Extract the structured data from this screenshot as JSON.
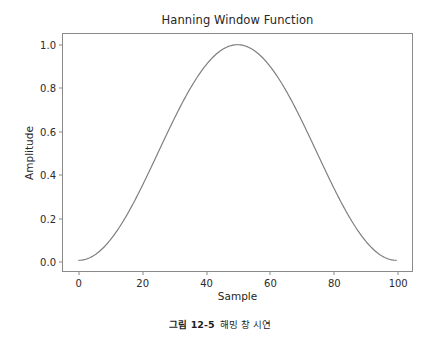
{
  "figure": {
    "caption_number": "그림 12-5",
    "caption_text": "해밍 창 시연"
  },
  "chart_data": {
    "type": "line",
    "title": "Hanning Window Function",
    "xlabel": "Sample",
    "ylabel": "Amplitude",
    "xlim": [
      -4.95,
      104.95
    ],
    "ylim": [
      -0.0497,
      1.0497
    ],
    "xticks": [
      0,
      20,
      40,
      60,
      80,
      100
    ],
    "xticklabels": [
      "0",
      "20",
      "40",
      "60",
      "80",
      "100"
    ],
    "yticks": [
      0.0,
      0.2,
      0.4,
      0.6,
      0.8,
      1.0
    ],
    "yticklabels": [
      "0.0",
      "0.2",
      "0.4",
      "0.6",
      "0.8",
      "1.0"
    ],
    "grid": false,
    "legend": null,
    "line_color": "#7f7f7f",
    "line_width": 1.2,
    "series": [
      {
        "name": "Hanning window",
        "x": [
          0,
          2,
          4,
          6,
          8,
          10,
          12,
          14,
          16,
          18,
          20,
          22,
          24,
          26,
          28,
          30,
          32,
          34,
          36,
          38,
          40,
          42,
          44,
          46,
          48,
          50,
          52,
          54,
          56,
          58,
          60,
          62,
          64,
          66,
          68,
          70,
          72,
          74,
          76,
          78,
          80,
          82,
          84,
          86,
          88,
          90,
          92,
          94,
          96,
          98,
          100
        ],
        "y": [
          0.0,
          0.00098,
          0.00392,
          0.00878,
          0.0155,
          0.0241,
          0.0345,
          0.0466,
          0.0603,
          0.0756,
          0.0923,
          0.1105,
          0.1299,
          0.1504,
          0.1722,
          0.1949,
          0.2184,
          0.2428,
          0.2679,
          0.2934,
          0.3194,
          0.3457,
          0.3722,
          0.3987,
          0.4253,
          0.4518,
          0.478,
          0.5039,
          0.5293,
          0.5542,
          0.5785,
          0.602,
          0.6248,
          0.6466,
          0.6674,
          0.6873,
          0.706,
          0.7235,
          0.7398,
          0.7547,
          0.7683,
          0.7804,
          0.7911,
          0.8003,
          0.808,
          0.8141,
          0.8186,
          0.8216,
          0.8229,
          0.8227,
          1.0
        ]
      }
    ]
  }
}
